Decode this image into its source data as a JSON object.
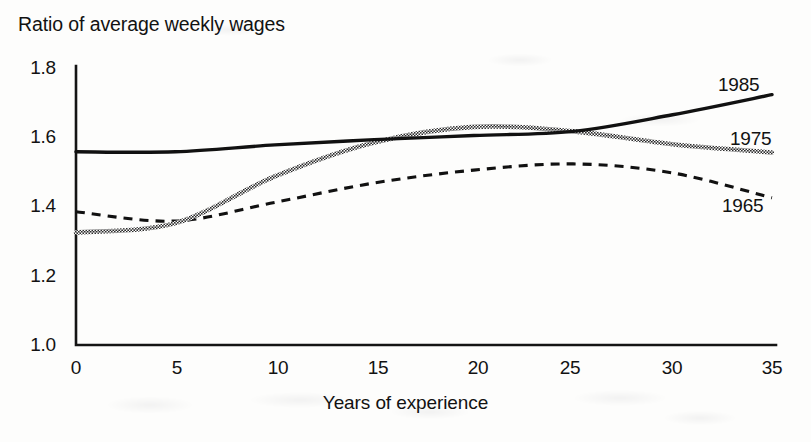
{
  "chart_data": {
    "type": "line",
    "title": "Ratio of average weekly wages",
    "xlabel": "Years of experience",
    "ylabel": "",
    "xlim": [
      0,
      35
    ],
    "ylim": [
      1.0,
      1.8
    ],
    "grid": false,
    "legend_position": "right-inline-labels",
    "xticks": [
      "0",
      "5",
      "10",
      "15",
      "20",
      "25",
      "30",
      "35"
    ],
    "yticks": [
      "1.0",
      "1.2",
      "1.4",
      "1.6",
      "1.8"
    ],
    "x": [
      0,
      5,
      10,
      15,
      20,
      25,
      30,
      35
    ],
    "series": [
      {
        "name": "1985",
        "style": "solid",
        "color": "#111111",
        "values": [
          1.558,
          1.558,
          1.578,
          1.593,
          1.605,
          1.617,
          1.665,
          1.723
        ]
      },
      {
        "name": "1975",
        "style": "stippled",
        "color": "#4d4d4d",
        "values": [
          1.325,
          1.352,
          1.487,
          1.585,
          1.63,
          1.617,
          1.58,
          1.556
        ]
      },
      {
        "name": "1965",
        "style": "dashed",
        "color": "#111111",
        "values": [
          1.385,
          1.358,
          1.412,
          1.468,
          1.505,
          1.523,
          1.497,
          1.425
        ]
      }
    ]
  },
  "axis": {
    "y_label_positions": [
      68,
      137,
      206,
      276,
      345
    ],
    "x_label_positions": [
      76,
      177,
      278,
      378,
      478,
      570,
      672,
      772
    ]
  },
  "series_labels": [
    {
      "text": "1985",
      "x": 718,
      "y": 74
    },
    {
      "text": "1975",
      "x": 730,
      "y": 128
    },
    {
      "text": "1965",
      "x": 722,
      "y": 195
    }
  ]
}
